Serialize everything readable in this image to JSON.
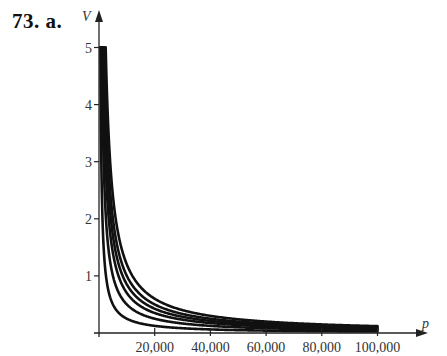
{
  "problem_label": "73. a.",
  "chart_data": {
    "type": "line",
    "title": "",
    "xlabel": "p",
    "ylabel": "V",
    "xlim": [
      0,
      100000
    ],
    "ylim": [
      0,
      5
    ],
    "x_ticks": [
      20000,
      40000,
      60000,
      80000,
      100000
    ],
    "x_tick_labels": [
      "20,000",
      "40,000",
      "60,000",
      "80,000",
      "100,000"
    ],
    "y_ticks": [
      1,
      2,
      3,
      4,
      5
    ],
    "y_tick_labels": [
      "1",
      "2",
      "3",
      "4",
      "5"
    ],
    "grid": false,
    "legend": null,
    "series": [
      {
        "name": "curve-1",
        "k": 2500
      },
      {
        "name": "curve-2",
        "k": 5000
      },
      {
        "name": "curve-3",
        "k": 7000
      },
      {
        "name": "curve-4",
        "k": 8500
      },
      {
        "name": "curve-5",
        "k": 10000
      },
      {
        "name": "curve-6",
        "k": 12000
      }
    ]
  },
  "layout": {
    "origin_px": [
      99,
      333
    ],
    "x_px_per_unit": 0.002785,
    "y_px_per_unit": 57.1,
    "x_axis_end_px": 428,
    "y_axis_top_px": 10
  },
  "colors": {
    "curve": "#111111",
    "axis": "#222222"
  }
}
